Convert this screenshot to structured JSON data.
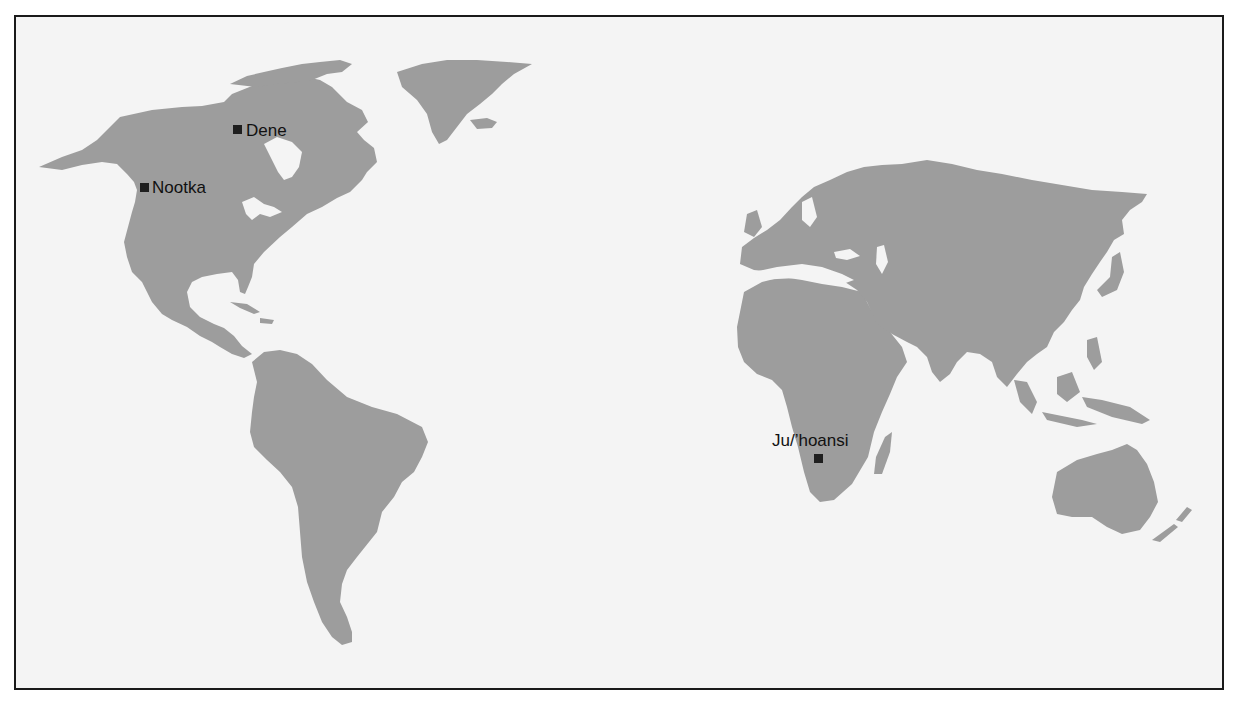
{
  "map": {
    "type": "world-map",
    "land_color": "#9d9d9d",
    "ocean_color": "#f4f4f4",
    "border_color": "#1a1a1a",
    "marker_color": "#1f1f1f",
    "locations": [
      {
        "id": "dene",
        "label": "Dene",
        "marker": "square",
        "region": "northern Canada"
      },
      {
        "id": "nootka",
        "label": "Nootka",
        "marker": "square",
        "region": "Pacific Northwest coast"
      },
      {
        "id": "juhoansi",
        "label": "Ju/’hoansi",
        "marker": "square",
        "region": "southern Africa"
      }
    ]
  }
}
